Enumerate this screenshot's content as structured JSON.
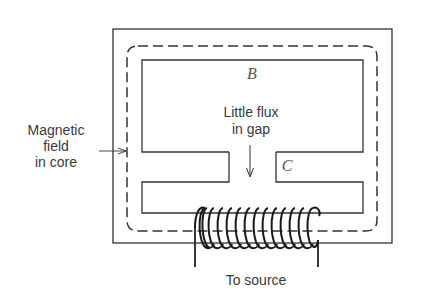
{
  "diagram": {
    "labels": {
      "region_b": "B",
      "region_c": "C",
      "gap_note_line1": "Little flux",
      "gap_note_line2": "in gap",
      "core_note_line1": "Magnetic",
      "core_note_line2": "field",
      "core_note_line3": "in core",
      "source": "To source"
    },
    "colors": {
      "line": "#333333",
      "text": "#3a3a3a",
      "background": "#ffffff"
    },
    "coil": {
      "turns": 12
    }
  }
}
